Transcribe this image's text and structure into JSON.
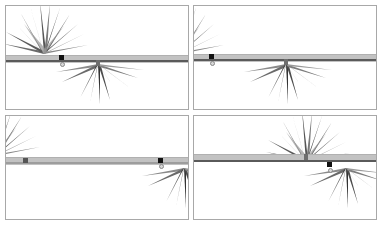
{
  "figure": {
    "layout": "2x2 grid of frames",
    "panels": [
      {
        "id": "top-left",
        "bursts": [
          "upper-left",
          "lower-center"
        ],
        "handle": "left-quarter"
      },
      {
        "id": "top-right",
        "bursts": [
          "upper-left-edge",
          "lower-center"
        ],
        "handle": "left"
      },
      {
        "id": "bottom-left",
        "bursts": [
          "upper-left-edge",
          "lower-right-edge"
        ],
        "handle": "right"
      },
      {
        "id": "bottom-right",
        "bursts": [
          "upper-center-right",
          "lower-right"
        ],
        "handle": "right-center"
      }
    ],
    "colors": {
      "border": "#a8a8a8",
      "bar": "#c2c2c2",
      "bar_line": "#5a5a5a",
      "burst": "#555555",
      "handle": "#111111"
    }
  }
}
